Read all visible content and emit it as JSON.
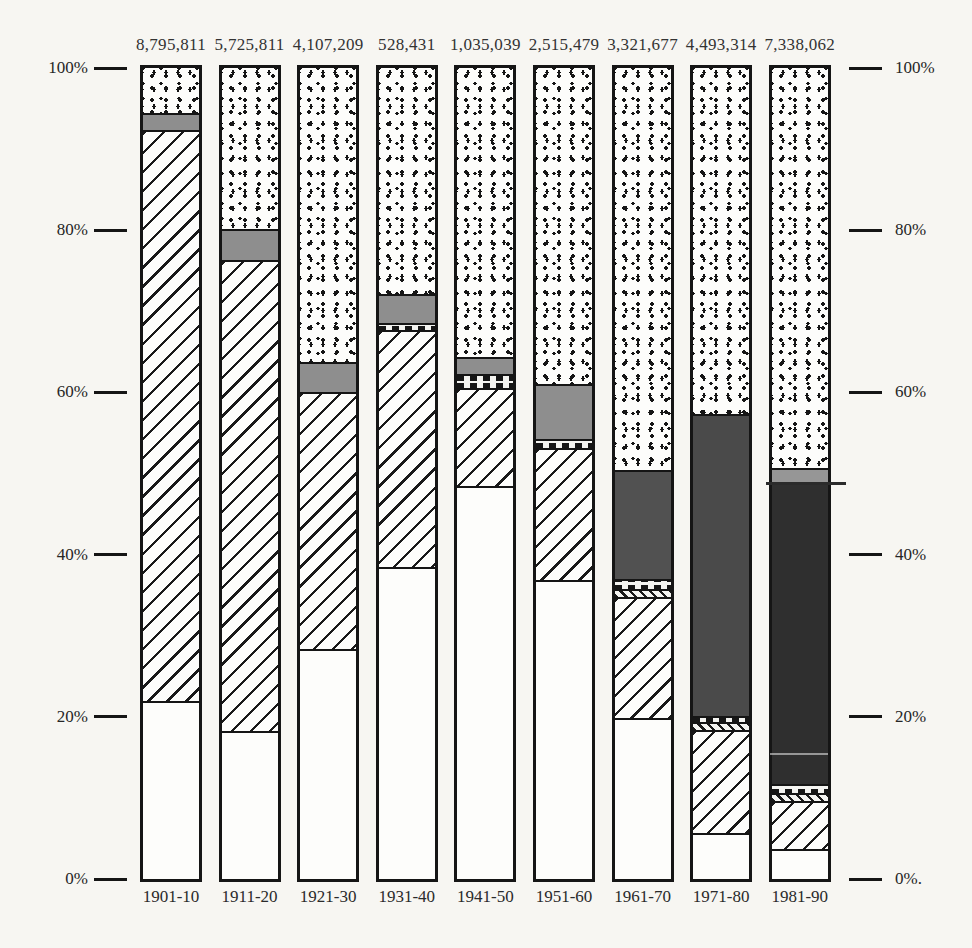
{
  "colors": {
    "ink": "#1a1a1a",
    "paper": "#f7f6f2",
    "gray_fill": "#8e8e8e",
    "dark_fill": "#4c4c4c",
    "darkest_fill": "#2f2f2f"
  },
  "axis": {
    "ticks": [
      {
        "pct": 100,
        "left": "100%",
        "right": "100%"
      },
      {
        "pct": 80,
        "left": "80%",
        "right": "80%"
      },
      {
        "pct": 60,
        "left": "60%",
        "right": "60%"
      },
      {
        "pct": 40,
        "left": "40%",
        "right": "40%"
      },
      {
        "pct": 20,
        "left": "20%",
        "right": "20%"
      },
      {
        "pct": 0,
        "left": "0%",
        "right": "0%."
      }
    ]
  },
  "chart_data": {
    "type": "bar",
    "stacked": true,
    "value_unit": "percent of decade total",
    "ylim": [
      0,
      100
    ],
    "grid": false,
    "legend": "none visible",
    "categories": [
      "1901-10",
      "1911-20",
      "1921-30",
      "1931-40",
      "1941-50",
      "1951-60",
      "1961-70",
      "1971-80",
      "1981-90"
    ],
    "bar_totals": [
      "8,795,811",
      "5,725,811",
      "4,107,209",
      "528,431",
      "1,035,039",
      "2,515,479",
      "3,321,677",
      "4,493,314",
      "7,338,062"
    ],
    "pattern_keys": [
      "plain",
      "hatch",
      "diag",
      "stripe",
      "gray",
      "dark",
      "dotted"
    ],
    "bars": [
      {
        "category": "1901-10",
        "total": "8,795,811",
        "segments": [
          {
            "pattern": "plain",
            "from": 0,
            "to": 22.0
          },
          {
            "pattern": "hatch",
            "from": 22.0,
            "to": 92.3
          },
          {
            "pattern": "gray",
            "from": 92.3,
            "to": 94.4,
            "color": "#8e8e8e"
          },
          {
            "pattern": "dotted",
            "from": 94.4,
            "to": 100
          }
        ]
      },
      {
        "category": "1911-20",
        "total": "5,725,811",
        "segments": [
          {
            "pattern": "plain",
            "from": 0,
            "to": 18.3
          },
          {
            "pattern": "hatch",
            "from": 18.3,
            "to": 76.3
          },
          {
            "pattern": "gray",
            "from": 76.3,
            "to": 80.2,
            "color": "#8e8e8e"
          },
          {
            "pattern": "dotted",
            "from": 80.2,
            "to": 100
          }
        ]
      },
      {
        "category": "1921-30",
        "total": "4,107,209",
        "segments": [
          {
            "pattern": "plain",
            "from": 0,
            "to": 28.4
          },
          {
            "pattern": "hatch",
            "from": 28.4,
            "to": 60.0
          },
          {
            "pattern": "gray",
            "from": 60.0,
            "to": 63.8,
            "color": "#8e8e8e"
          },
          {
            "pattern": "dotted",
            "from": 63.8,
            "to": 100
          }
        ]
      },
      {
        "category": "1931-40",
        "total": "528,431",
        "segments": [
          {
            "pattern": "plain",
            "from": 0,
            "to": 38.5
          },
          {
            "pattern": "hatch",
            "from": 38.5,
            "to": 67.7
          },
          {
            "pattern": "stripe",
            "from": 67.7,
            "to": 68.6
          },
          {
            "pattern": "gray",
            "from": 68.6,
            "to": 72.1,
            "color": "#8e8e8e"
          },
          {
            "pattern": "dotted",
            "from": 72.1,
            "to": 100
          }
        ]
      },
      {
        "category": "1941-50",
        "total": "1,035,039",
        "segments": [
          {
            "pattern": "plain",
            "from": 0,
            "to": 48.5
          },
          {
            "pattern": "hatch",
            "from": 48.5,
            "to": 60.6
          },
          {
            "pattern": "stripe",
            "from": 60.6,
            "to": 62.3
          },
          {
            "pattern": "gray",
            "from": 62.3,
            "to": 64.4,
            "color": "#8e8e8e"
          },
          {
            "pattern": "dotted",
            "from": 64.4,
            "to": 100
          }
        ]
      },
      {
        "category": "1951-60",
        "total": "2,515,479",
        "segments": [
          {
            "pattern": "plain",
            "from": 0,
            "to": 36.9
          },
          {
            "pattern": "hatch",
            "from": 36.9,
            "to": 53.1
          },
          {
            "pattern": "stripe",
            "from": 53.1,
            "to": 54.2
          },
          {
            "pattern": "gray",
            "from": 54.2,
            "to": 61.0,
            "color": "#8e8e8e"
          },
          {
            "pattern": "dotted",
            "from": 61.0,
            "to": 100
          }
        ]
      },
      {
        "category": "1961-70",
        "total": "3,321,677",
        "segments": [
          {
            "pattern": "plain",
            "from": 0,
            "to": 19.9
          },
          {
            "pattern": "hatch",
            "from": 19.9,
            "to": 34.8
          },
          {
            "pattern": "diag",
            "from": 34.8,
            "to": 35.8
          },
          {
            "pattern": "stripe",
            "from": 35.8,
            "to": 37.0
          },
          {
            "pattern": "dark",
            "from": 37.0,
            "to": 50.4,
            "color": "#515151"
          },
          {
            "pattern": "dotted",
            "from": 50.4,
            "to": 100
          }
        ]
      },
      {
        "category": "1971-80",
        "total": "4,493,314",
        "segments": [
          {
            "pattern": "plain",
            "from": 0,
            "to": 5.7
          },
          {
            "pattern": "hatch",
            "from": 5.7,
            "to": 18.4
          },
          {
            "pattern": "diag",
            "from": 18.4,
            "to": 19.3
          },
          {
            "pattern": "stripe",
            "from": 19.3,
            "to": 20.1
          },
          {
            "pattern": "dark",
            "from": 20.1,
            "to": 57.3,
            "color": "#4a4a4a"
          },
          {
            "pattern": "dotted",
            "from": 57.3,
            "to": 100
          }
        ]
      },
      {
        "category": "1981-90",
        "total": "7,338,062",
        "segments": [
          {
            "pattern": "plain",
            "from": 0,
            "to": 3.7
          },
          {
            "pattern": "hatch",
            "from": 3.7,
            "to": 9.6
          },
          {
            "pattern": "diag",
            "from": 9.6,
            "to": 10.6
          },
          {
            "pattern": "stripe",
            "from": 10.6,
            "to": 11.7
          },
          {
            "pattern": "dark",
            "from": 11.7,
            "to": 48.8,
            "color": "#2f2f2f"
          },
          {
            "pattern": "gray",
            "from": 48.8,
            "to": 50.7,
            "color": "#969696"
          },
          {
            "pattern": "dotted",
            "from": 50.7,
            "to": 100
          }
        ]
      }
    ]
  }
}
